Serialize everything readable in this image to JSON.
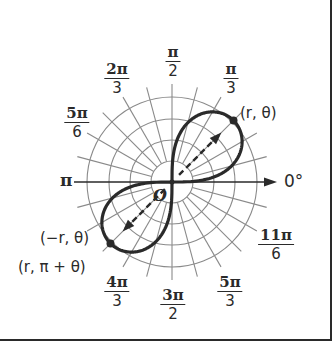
{
  "diagram": {
    "colors": {
      "grid": "#8a8a8a",
      "curve": "#2a2a2a",
      "text": "#2a2a2a",
      "background": "#ffffff",
      "border": "#2a2a2a"
    },
    "center": {
      "x": 172,
      "y": 182
    },
    "grid": {
      "circle_radii": [
        21,
        42,
        63,
        85
      ],
      "spoke_length": 98,
      "spoke_step_deg": 15,
      "inner_spoke_start": 21
    },
    "axis": {
      "arrow_end_x": 277,
      "label": "0°"
    },
    "origin_label": "O",
    "angle_labels": [
      {
        "id": "pi-over-2",
        "num": "π",
        "den": "2",
        "x": 173,
        "y": 45
      },
      {
        "id": "2pi-over-3",
        "num": "2π",
        "den": "3",
        "x": 117,
        "y": 62
      },
      {
        "id": "pi-over-3",
        "num": "π",
        "den": "3",
        "x": 231,
        "y": 62
      },
      {
        "id": "5pi-over-6",
        "num": "5π",
        "den": "6",
        "x": 77,
        "y": 106
      },
      {
        "id": "11pi-over-6",
        "num": "11π",
        "den": "6",
        "x": 276,
        "y": 228
      },
      {
        "id": "4pi-over-3",
        "num": "4π",
        "den": "3",
        "x": 117,
        "y": 275
      },
      {
        "id": "3pi-over-2",
        "num": "3π",
        "den": "2",
        "x": 173,
        "y": 288
      },
      {
        "id": "5pi-over-3",
        "num": "5π",
        "den": "3",
        "x": 230,
        "y": 275
      }
    ],
    "pi_label": "π",
    "point_labels": {
      "r_theta": "(r, θ)",
      "neg_r_theta": "(−r, θ)",
      "r_pi_plus_theta": "(r, π + θ)"
    },
    "curve": {
      "type": "lemniscate",
      "equation": "r² = a² sin 2θ",
      "a": 87
    },
    "points": [
      {
        "name": "r-theta-point",
        "angle_deg": 45,
        "r": 87
      },
      {
        "name": "neg-r-theta-point",
        "angle_deg": 225,
        "r": 87
      }
    ]
  }
}
